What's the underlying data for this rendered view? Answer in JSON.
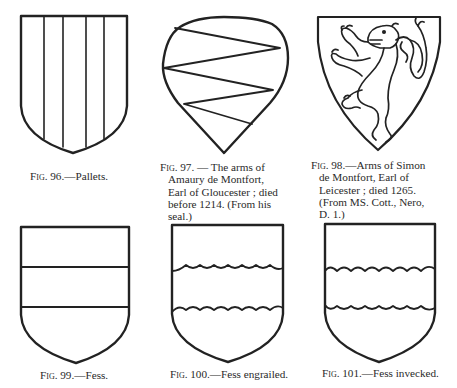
{
  "page": {
    "type": "heraldry-figures-plate",
    "ink_color": "#222222",
    "paper_color": "#ffffff"
  },
  "figures": [
    {
      "id": "fig-96",
      "number_label": "Fig. 96.",
      "caption": "—Pallets.",
      "shield_shape": "heater",
      "charge": "four vertical pallet lines"
    },
    {
      "id": "fig-97",
      "number_label": "Fig. 97.",
      "caption_lines": [
        "— The arms of",
        "Amaury de Montfort,",
        "Earl of Gloucester ; died",
        "before 1214. (From his",
        "seal.)"
      ],
      "shield_shape": "heart / pear-shaped",
      "charge": "zig-zag diagonal lines"
    },
    {
      "id": "fig-98",
      "number_label": "Fig. 98.",
      "caption_lines": [
        "—Arms of Simon",
        "de Montfort, Earl of",
        "Leicester ; died 1265.",
        "(From MS. Cott., Nero,",
        "D. 1.)"
      ],
      "shield_shape": "triangular heater",
      "charge": "lion rampant with forked tail"
    },
    {
      "id": "fig-99",
      "number_label": "Fig. 99.",
      "caption": "—Fess.",
      "shield_shape": "heater",
      "charge": "fess with straight lines"
    },
    {
      "id": "fig-100",
      "number_label": "Fig. 100.",
      "caption": "—Fess engrailed.",
      "shield_shape": "heater",
      "charge": "fess with engrailed lines"
    },
    {
      "id": "fig-101",
      "number_label": "Fig. 101.",
      "caption": "—Fess invecked.",
      "shield_shape": "heater",
      "charge": "fess with invecked lines"
    }
  ]
}
